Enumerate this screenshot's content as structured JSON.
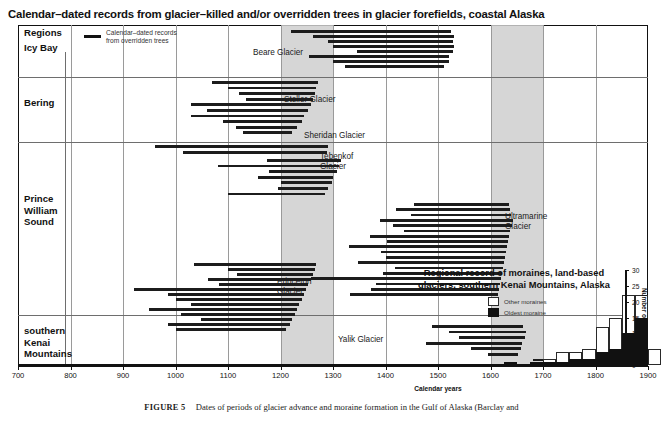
{
  "figure": {
    "main_title": "Calendar–dated records from glacier–killed and/or overridden trees in glacier forefields, coastal Alaska",
    "caption_label": "FIGURE 5",
    "caption_text": "Dates of periods of glacier advance and moraine formation in the Gulf of Alaska (Barclay and",
    "x_axis_title": "Calendar years",
    "regions_header": "Regions"
  },
  "key": {
    "label": "Calendar–dated records\nfrom overridden trees",
    "line_color": "#111111"
  },
  "regions": [
    {
      "name": "Icy Bay",
      "label": "Icy Bay",
      "y_top": 0,
      "y_bottom": 52
    },
    {
      "name": "Bering",
      "label": "Bering",
      "y_top": 52,
      "y_bottom": 117
    },
    {
      "name": "Prince William Sound",
      "label": "Prince\nWilliam\nSound",
      "y_top": 117,
      "y_bottom": 290
    },
    {
      "name": "southern Kenai Mountains",
      "label": "southern\nKenai\nMountains",
      "y_top": 290,
      "y_bottom": 340
    }
  ],
  "glacier_labels": [
    {
      "name": "Beare Glacier",
      "text": "Beare Glacier",
      "x": 253,
      "y": 48
    },
    {
      "name": "Steller Glacier",
      "text": "Steller Glacier",
      "x": 284,
      "y": 95
    },
    {
      "name": "Sheridan Glacier",
      "text": "Sheridan Glacier",
      "x": 304,
      "y": 131
    },
    {
      "name": "Tebenkof Glacier",
      "text": "Tebenkof\nGlacier",
      "x": 320,
      "y": 152
    },
    {
      "name": "Ultramarine Glacier",
      "text": "Ultramarine\nGlacier",
      "x": 505,
      "y": 212
    },
    {
      "name": "Princeton Glacier",
      "text": "Princeton\nGlacier",
      "x": 277,
      "y": 277
    },
    {
      "name": "Yalik Glacier",
      "text": "Yalik Glacier",
      "x": 338,
      "y": 335
    }
  ],
  "chart_data": {
    "type": "bar",
    "title": "Calendar–dated records from glacier–killed and/or overridden trees in glacier forefields, coastal Alaska",
    "xlabel": "Calendar years",
    "ylabel": "",
    "xlim": [
      700,
      1900
    ],
    "xticks": [
      700,
      800,
      900,
      1000,
      1100,
      1200,
      1300,
      1400,
      1500,
      1600,
      1700,
      1800,
      1900
    ],
    "grid": true,
    "orientation": "horizontal",
    "shaded_bands": [
      {
        "name": "band-1200-1300",
        "from": 1200,
        "to": 1300,
        "color": "#cfcfcf"
      },
      {
        "name": "band-1600-1700",
        "from": 1600,
        "to": 1700,
        "color": "#cfcfcf"
      }
    ],
    "note": "Each record is a horizontal bar spanning the calendar-year range of a glacier-killed / overridden tree record.",
    "records": [
      {
        "region": "Icy Bay",
        "glacier": "Beare Glacier",
        "row": 0,
        "start": 1220,
        "end": 1525
      },
      {
        "region": "Icy Bay",
        "glacier": "Beare Glacier",
        "row": 1,
        "start": 1262,
        "end": 1530
      },
      {
        "region": "Icy Bay",
        "glacier": "Beare Glacier",
        "row": 2,
        "start": 1290,
        "end": 1528
      },
      {
        "region": "Icy Bay",
        "glacier": "Beare Glacier",
        "row": 3,
        "start": 1300,
        "end": 1530
      },
      {
        "region": "Icy Bay",
        "glacier": "Beare Glacier",
        "row": 4,
        "start": 1345,
        "end": 1528
      },
      {
        "region": "Icy Bay",
        "glacier": "Beare Glacier",
        "row": 5,
        "start": 1255,
        "end": 1520
      },
      {
        "region": "Icy Bay",
        "glacier": "Beare Glacier",
        "row": 6,
        "start": 1300,
        "end": 1520
      },
      {
        "region": "Icy Bay",
        "glacier": "Beare Glacier",
        "row": 7,
        "start": 1322,
        "end": 1512
      },
      {
        "region": "Bering",
        "glacier": "Steller Glacier",
        "row": 0,
        "start": 1070,
        "end": 1272
      },
      {
        "region": "Bering",
        "glacier": "Steller Glacier",
        "row": 1,
        "start": 1100,
        "end": 1268
      },
      {
        "region": "Bering",
        "glacier": "Steller Glacier",
        "row": 2,
        "start": 1120,
        "end": 1265
      },
      {
        "region": "Bering",
        "glacier": "Steller Glacier",
        "row": 3,
        "start": 1135,
        "end": 1262
      },
      {
        "region": "Bering",
        "glacier": "Steller Glacier",
        "row": 4,
        "start": 1030,
        "end": 1258
      },
      {
        "region": "Bering",
        "glacier": "Steller Glacier",
        "row": 5,
        "start": 1060,
        "end": 1252
      },
      {
        "region": "Bering",
        "glacier": "Steller Glacier",
        "row": 6,
        "start": 1030,
        "end": 1245
      },
      {
        "region": "Bering",
        "glacier": "Steller Glacier",
        "row": 7,
        "start": 1090,
        "end": 1240
      },
      {
        "region": "Bering",
        "glacier": "Steller Glacier",
        "row": 8,
        "start": 1115,
        "end": 1232
      },
      {
        "region": "Bering",
        "glacier": "Steller Glacier",
        "row": 9,
        "start": 1128,
        "end": 1222
      },
      {
        "region": "Prince William Sound",
        "glacier": "Sheridan Glacier",
        "row": 0,
        "start": 960,
        "end": 1290
      },
      {
        "region": "Prince William Sound",
        "glacier": "Sheridan Glacier",
        "row": 1,
        "start": 1015,
        "end": 1288
      },
      {
        "region": "Prince William Sound",
        "glacier": "Tebenkof Glacier",
        "row": 0,
        "start": 1175,
        "end": 1315
      },
      {
        "region": "Prince William Sound",
        "glacier": "Tebenkof Glacier",
        "row": 1,
        "start": 1080,
        "end": 1312
      },
      {
        "region": "Prince William Sound",
        "glacier": "Tebenkof Glacier",
        "row": 2,
        "start": 1178,
        "end": 1308
      },
      {
        "region": "Prince William Sound",
        "glacier": "Tebenkof Glacier",
        "row": 3,
        "start": 1158,
        "end": 1300
      },
      {
        "region": "Prince William Sound",
        "glacier": "Tebenkof Glacier",
        "row": 4,
        "start": 1200,
        "end": 1298
      },
      {
        "region": "Prince William Sound",
        "glacier": "Tebenkof Glacier",
        "row": 5,
        "start": 1196,
        "end": 1290
      },
      {
        "region": "Prince William Sound",
        "glacier": "Tebenkof Glacier",
        "row": 6,
        "start": 1100,
        "end": 1285
      },
      {
        "region": "Prince William Sound",
        "glacier": "Ultramarine Glacier",
        "row": 0,
        "start": 1455,
        "end": 1635
      },
      {
        "region": "Prince William Sound",
        "glacier": "Ultramarine Glacier",
        "row": 1,
        "start": 1420,
        "end": 1638
      },
      {
        "region": "Prince William Sound",
        "glacier": "Ultramarine Glacier",
        "row": 2,
        "start": 1448,
        "end": 1640
      },
      {
        "region": "Prince William Sound",
        "glacier": "Ultramarine Glacier",
        "row": 3,
        "start": 1390,
        "end": 1642
      },
      {
        "region": "Prince William Sound",
        "glacier": "Ultramarine Glacier",
        "row": 4,
        "start": 1415,
        "end": 1640
      },
      {
        "region": "Prince William Sound",
        "glacier": "Ultramarine Glacier",
        "row": 5,
        "start": 1435,
        "end": 1638
      },
      {
        "region": "Prince William Sound",
        "glacier": "Ultramarine Glacier",
        "row": 6,
        "start": 1370,
        "end": 1636
      },
      {
        "region": "Prince William Sound",
        "glacier": "Ultramarine Glacier",
        "row": 7,
        "start": 1402,
        "end": 1634
      },
      {
        "region": "Prince William Sound",
        "glacier": "Ultramarine Glacier",
        "row": 8,
        "start": 1330,
        "end": 1632
      },
      {
        "region": "Prince William Sound",
        "glacier": "Ultramarine Glacier",
        "row": 9,
        "start": 1392,
        "end": 1630
      },
      {
        "region": "Prince William Sound",
        "glacier": "Ultramarine Glacier",
        "row": 10,
        "start": 1400,
        "end": 1628
      },
      {
        "region": "Prince William Sound",
        "glacier": "Ultramarine Glacier",
        "row": 11,
        "start": 1348,
        "end": 1626
      },
      {
        "region": "Prince William Sound",
        "glacier": "Ultramarine Glacier",
        "row": 12,
        "start": 1418,
        "end": 1624
      },
      {
        "region": "Prince William Sound",
        "glacier": "Ultramarine Glacier",
        "row": 13,
        "start": 1395,
        "end": 1622
      },
      {
        "region": "Prince William Sound",
        "glacier": "Ultramarine Glacier",
        "row": 14,
        "start": 1258,
        "end": 1620
      },
      {
        "region": "Prince William Sound",
        "glacier": "Ultramarine Glacier",
        "row": 15,
        "start": 1382,
        "end": 1618
      },
      {
        "region": "Prince William Sound",
        "glacier": "Ultramarine Glacier",
        "row": 16,
        "start": 1372,
        "end": 1616
      },
      {
        "region": "Prince William Sound",
        "glacier": "Ultramarine Glacier",
        "row": 17,
        "start": 1332,
        "end": 1614
      },
      {
        "region": "Prince William Sound",
        "glacier": "Princeton Glacier",
        "row": 0,
        "start": 1035,
        "end": 1268
      },
      {
        "region": "Prince William Sound",
        "glacier": "Princeton Glacier",
        "row": 1,
        "start": 1100,
        "end": 1266
      },
      {
        "region": "Prince William Sound",
        "glacier": "Princeton Glacier",
        "row": 2,
        "start": 1118,
        "end": 1262
      },
      {
        "region": "Prince William Sound",
        "glacier": "Princeton Glacier",
        "row": 3,
        "start": 1062,
        "end": 1258
      },
      {
        "region": "Prince William Sound",
        "glacier": "Princeton Glacier",
        "row": 4,
        "start": 1082,
        "end": 1252
      },
      {
        "region": "Prince William Sound",
        "glacier": "Princeton Glacier",
        "row": 5,
        "start": 920,
        "end": 1248
      },
      {
        "region": "Prince William Sound",
        "glacier": "Princeton Glacier",
        "row": 6,
        "start": 985,
        "end": 1244
      },
      {
        "region": "Prince William Sound",
        "glacier": "Princeton Glacier",
        "row": 7,
        "start": 1000,
        "end": 1240
      },
      {
        "region": "Prince William Sound",
        "glacier": "Princeton Glacier",
        "row": 8,
        "start": 1030,
        "end": 1236
      },
      {
        "region": "Prince William Sound",
        "glacier": "Princeton Glacier",
        "row": 9,
        "start": 950,
        "end": 1232
      },
      {
        "region": "Prince William Sound",
        "glacier": "Princeton Glacier",
        "row": 10,
        "start": 1010,
        "end": 1228
      },
      {
        "region": "Prince William Sound",
        "glacier": "Princeton Glacier",
        "row": 11,
        "start": 1048,
        "end": 1222
      },
      {
        "region": "Prince William Sound",
        "glacier": "Princeton Glacier",
        "row": 12,
        "start": 985,
        "end": 1218
      },
      {
        "region": "Prince William Sound",
        "glacier": "Princeton Glacier",
        "row": 13,
        "start": 1000,
        "end": 1210
      },
      {
        "region": "southern Kenai Mountains",
        "glacier": "Yalik Glacier",
        "row": 0,
        "start": 1488,
        "end": 1662
      },
      {
        "region": "southern Kenai Mountains",
        "glacier": "Yalik Glacier",
        "row": 1,
        "start": 1520,
        "end": 1668
      },
      {
        "region": "southern Kenai Mountains",
        "glacier": "Yalik Glacier",
        "row": 2,
        "start": 1540,
        "end": 1665
      },
      {
        "region": "southern Kenai Mountains",
        "glacier": "Yalik Glacier",
        "row": 3,
        "start": 1478,
        "end": 1660
      },
      {
        "region": "southern Kenai Mountains",
        "glacier": "Yalik Glacier",
        "row": 4,
        "start": 1562,
        "end": 1658
      },
      {
        "region": "southern Kenai Mountains",
        "glacier": "Yalik Glacier",
        "row": 5,
        "start": 1596,
        "end": 1652
      },
      {
        "region": "southern Kenai Mountains",
        "glacier": "Yalik Glacier",
        "row": 6,
        "start": 1680,
        "end": 1760
      }
    ]
  },
  "inset": {
    "title": "Regional record of moraines, land-based\nglaciers, southern Kenai Mountains, Alaska",
    "legend": [
      {
        "name": "other-moraines",
        "label": "Other moraines",
        "fill": "#ffffff"
      },
      {
        "name": "oldest-moraine",
        "label": "Oldest moraine",
        "fill": "#111111"
      }
    ],
    "y_title": "Number of moraines",
    "chart_data": {
      "type": "bar",
      "title": "Regional record of moraines, land-based glaciers, southern Kenai Mountains, Alaska",
      "xlabel": "Calendar years",
      "ylabel": "Number of moraines",
      "ylim": [
        0,
        30
      ],
      "yticks": [
        0,
        5,
        10,
        15,
        20,
        25,
        30
      ],
      "xlim": [
        1600,
        1925
      ],
      "bin_width": 25,
      "stacked": true,
      "categories": [
        "1600-1625",
        "1625-1650",
        "1650-1675",
        "1675-1700",
        "1700-1725",
        "1725-1750",
        "1750-1775",
        "1775-1800",
        "1800-1825",
        "1825-1850",
        "1850-1875",
        "1875-1900",
        "1900-1925"
      ],
      "series": [
        {
          "name": "Oldest moraine",
          "color": "#111111",
          "values": [
            0,
            1,
            0,
            1,
            1,
            1,
            2,
            2,
            4,
            5,
            10,
            15,
            0
          ]
        },
        {
          "name": "Other moraines",
          "color": "#ffffff",
          "values": [
            0,
            0,
            0,
            0,
            1,
            3,
            2,
            3,
            8,
            10,
            12,
            7,
            5
          ]
        }
      ],
      "totals": [
        0,
        1,
        0,
        1,
        2,
        4,
        4,
        5,
        12,
        15,
        22,
        22,
        5
      ]
    }
  }
}
